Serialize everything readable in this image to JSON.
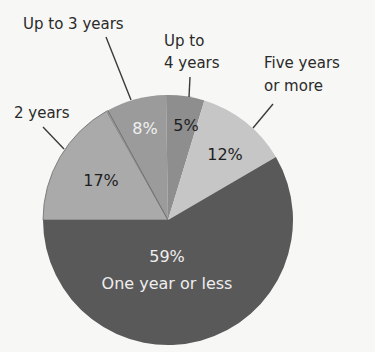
{
  "chart_data": {
    "type": "pie",
    "title": "",
    "start_angle_deg_clockwise_from_top": 270,
    "direction": "clockwise",
    "slices": [
      {
        "label": "2 years",
        "value": 17,
        "display": "17%",
        "color": "#aaaaaa",
        "text_color": "#1e1e1e"
      },
      {
        "label": "Up to 3 years",
        "value": 8,
        "display": "8%",
        "color": "#9b9b9b",
        "text_color": "#f0f0f0"
      },
      {
        "label": "Up to 4 years",
        "value": 5,
        "display": "5%",
        "color": "#8e8e8e",
        "text_color": "#1e1e1e"
      },
      {
        "label": "Five years or more",
        "value": 12,
        "display": "12%",
        "color": "#c6c6c6",
        "text_color": "#1e1e1e"
      },
      {
        "label": "One year or less",
        "value": 59,
        "display": "59%",
        "color": "#595959",
        "text_color": "#eeeeee"
      }
    ],
    "legend": "none (callout labels)"
  },
  "labels": {
    "two_years": "2 years",
    "up_to_3": "Up to 3 years",
    "up_to_4_line1": "Up to",
    "up_to_4_line2": "4 years",
    "five_plus_line1": "Five years",
    "five_plus_line2": "or more",
    "one_or_less": "One year or less"
  },
  "percents": {
    "two_years": "17%",
    "up_to_3": "8%",
    "up_to_4": "5%",
    "five_plus": "12%",
    "one_or_less": "59%"
  }
}
